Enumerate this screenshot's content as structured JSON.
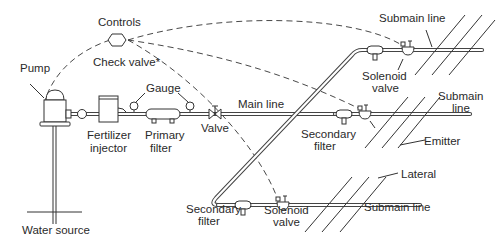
{
  "diagram": {
    "labels": {
      "controls": "Controls",
      "check_valve": "Check valve*",
      "pump": "Pump",
      "gauge": "Gauge",
      "main_line": "Main line",
      "valve": "Valve",
      "fertilizer_injector_1": "Fertilizer",
      "fertilizer_injector_2": "injector",
      "primary_filter_1": "Primary",
      "primary_filter_2": "filter",
      "water_source": "Water source",
      "submain_top": "Submain line",
      "solenoid_top_1": "Solenoid",
      "solenoid_top_2": "valve",
      "submain_mid_1": "Submain",
      "submain_mid_2": "line",
      "secondary_filter_mid_1": "Secondary",
      "secondary_filter_mid_2": "filter",
      "emitter": "Emitter",
      "lateral": "Lateral",
      "secondary_filter_bot_1": "Secondary",
      "secondary_filter_bot_2": "filter",
      "solenoid_bot_1": "Solenoid",
      "solenoid_bot_2": "valve",
      "submain_bot": "Submain line"
    },
    "colors": {
      "line": "#333333",
      "background": "#ffffff"
    }
  }
}
